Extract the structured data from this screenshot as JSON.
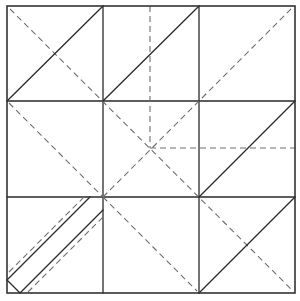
{
  "diagram": {
    "type": "origami-crease-pattern",
    "colors": {
      "background": "#ffffff",
      "solid_line": "#2a2a2a",
      "dashed_line": "#6e6e6e",
      "frame": "#333333"
    },
    "frame": {
      "x1": 7,
      "y1": 6,
      "x2": 295,
      "y2": 293
    },
    "grid": {
      "vertical_x": [
        103,
        199
      ],
      "horizontal_y": [
        101,
        197
      ]
    },
    "solid_lines": [
      {
        "id": "tl-diagonal",
        "x1": 7,
        "y1": 101,
        "x2": 103,
        "y2": 6
      },
      {
        "id": "tm-diagonal",
        "x1": 103,
        "y1": 101,
        "x2": 199,
        "y2": 6
      },
      {
        "id": "mr-diagonal",
        "x1": 199,
        "y1": 197,
        "x2": 295,
        "y2": 101
      },
      {
        "id": "br-diagonal",
        "x1": 199,
        "y1": 293,
        "x2": 295,
        "y2": 197
      },
      {
        "id": "bl-strip-upper",
        "x1": 7,
        "y1": 280,
        "x2": 90,
        "y2": 197
      },
      {
        "id": "bl-strip-lower",
        "x1": 20,
        "y1": 293,
        "x2": 103,
        "y2": 210
      },
      {
        "id": "bl-strip-cap",
        "x1": 7,
        "y1": 280,
        "x2": 20,
        "y2": 293
      }
    ],
    "dashed_lines": [
      {
        "id": "main-diagonal",
        "x1": 10,
        "y1": 9,
        "x2": 292,
        "y2": 290
      },
      {
        "id": "ml-diagonal",
        "x1": 9,
        "y1": 103,
        "x2": 103,
        "y2": 197
      },
      {
        "id": "bm-diagonal",
        "x1": 103,
        "y1": 197,
        "x2": 197,
        "y2": 291
      },
      {
        "id": "anti-diagonal",
        "x1": 103,
        "y1": 197,
        "x2": 292,
        "y2": 8
      },
      {
        "id": "center-vertical",
        "x1": 150,
        "y1": 6,
        "x2": 150,
        "y2": 148
      },
      {
        "id": "center-horizontal",
        "x1": 150,
        "y1": 148,
        "x2": 295,
        "y2": 148
      },
      {
        "id": "bl-strip-upper-dash",
        "x1": 9,
        "y1": 272,
        "x2": 84,
        "y2": 197
      },
      {
        "id": "bl-strip-lower-dash",
        "x1": 28,
        "y1": 292,
        "x2": 103,
        "y2": 217
      }
    ]
  }
}
